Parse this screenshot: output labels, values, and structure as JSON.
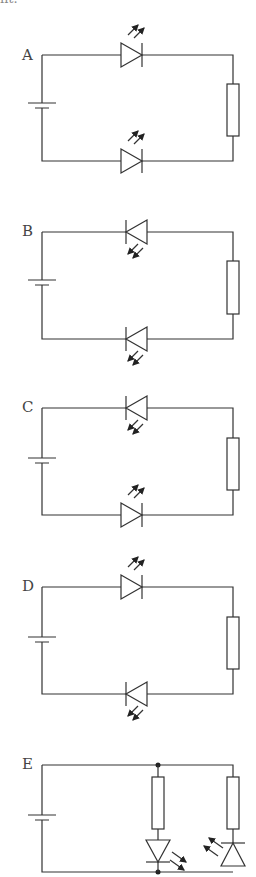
{
  "header": {
    "cropped_text": "nt."
  },
  "circuits": [
    {
      "label": "A",
      "top_led": "forward-emitting",
      "bottom_led": "forward-emitting",
      "top_y": 55,
      "bottom_y": 161
    },
    {
      "label": "B",
      "top_led": "reverse-absorbing",
      "bottom_led": "reverse-absorbing",
      "top_y": 232,
      "bottom_y": 339
    },
    {
      "label": "C",
      "top_led": "reverse-absorbing",
      "bottom_led": "forward-emitting",
      "top_y": 408,
      "bottom_y": 515
    },
    {
      "label": "D",
      "top_led": "forward-emitting",
      "bottom_led": "reverse-absorbing",
      "top_y": 587,
      "bottom_y": 694
    },
    {
      "label": "E",
      "layout": "parallel",
      "branch1": "resistor + LED (down, emitting)",
      "branch2": "resistor + photodiode (up, receiving)",
      "top_y": 765,
      "bottom_y": 872
    }
  ],
  "colors": {
    "line": "#333333",
    "label": "#444444",
    "background": "#ffffff"
  }
}
